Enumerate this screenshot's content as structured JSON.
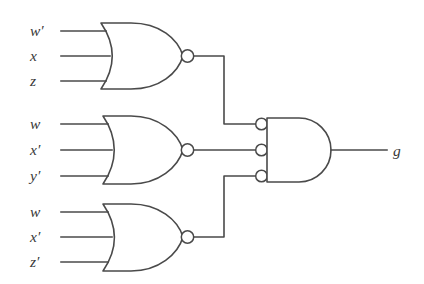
{
  "diagram": {
    "output_label": "g",
    "stroke_color": "#4a4a4a",
    "background_color": "#ffffff"
  },
  "gates": [
    {
      "id": "nor-gate-top",
      "type": "NOR",
      "inputs": [
        "w′",
        "x",
        "z"
      ],
      "input_labels": [
        {
          "base": "w",
          "prime": "′",
          "text": "w′"
        },
        {
          "base": "x",
          "prime": "",
          "text": "x"
        },
        {
          "base": "z",
          "prime": "",
          "text": "z"
        }
      ]
    },
    {
      "id": "nor-gate-middle",
      "type": "NOR",
      "inputs": [
        "w",
        "x′",
        "y′"
      ],
      "input_labels": [
        {
          "base": "w",
          "prime": "",
          "text": "w"
        },
        {
          "base": "x",
          "prime": "′",
          "text": "x′"
        },
        {
          "base": "y",
          "prime": "′",
          "text": "y′"
        }
      ]
    },
    {
      "id": "nor-gate-bottom",
      "type": "NOR",
      "inputs": [
        "w",
        "x′",
        "z′"
      ],
      "input_labels": [
        {
          "base": "w",
          "prime": "",
          "text": "w"
        },
        {
          "base": "x",
          "prime": "′",
          "text": "x′"
        },
        {
          "base": "z",
          "prime": "′",
          "text": "z′"
        }
      ]
    },
    {
      "id": "and-gate-output",
      "type": "AND",
      "inverted_inputs": true,
      "input_count": 3,
      "output": "g"
    }
  ],
  "labels": {
    "in_t1": "w",
    "in_t1_prime": "′",
    "in_t2": "x",
    "in_t2_prime": "",
    "in_t3": "z",
    "in_t3_prime": "",
    "in_m1": "w",
    "in_m1_prime": "",
    "in_m2": "x",
    "in_m2_prime": "′",
    "in_m3": "y",
    "in_m3_prime": "′",
    "in_b1": "w",
    "in_b1_prime": "",
    "in_b2": "x",
    "in_b2_prime": "′",
    "in_b3": "z",
    "in_b3_prime": "′",
    "out_g": "g"
  }
}
